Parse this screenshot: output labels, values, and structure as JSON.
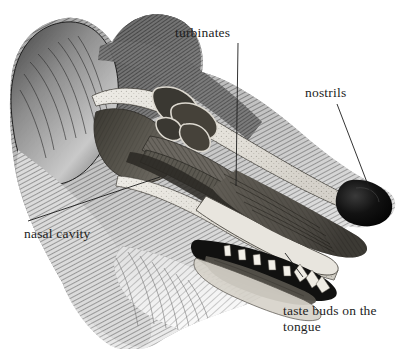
{
  "figure": {
    "background_color": "#ffffff",
    "ink_color": "#1d1d1d",
    "style": "engraving",
    "width": 403,
    "height": 349
  },
  "labels": [
    {
      "id": "turbinates",
      "text": "turbinates",
      "x": 175,
      "y": 25,
      "leader": {
        "x1": 238,
        "y1": 43,
        "x2": 236,
        "y2": 186
      }
    },
    {
      "id": "nostrils",
      "text": "nostrils",
      "x": 305,
      "y": 85,
      "leader": {
        "x1": 337,
        "y1": 104,
        "x2": 373,
        "y2": 198
      }
    },
    {
      "id": "nasal_cavity",
      "text": "nasal cavity",
      "x": 24,
      "y": 226,
      "leader": {
        "x1": 160,
        "y1": 177,
        "x2": 28,
        "y2": 221
      }
    },
    {
      "id": "taste_buds",
      "text": "taste buds on the\ntongue",
      "x": 283,
      "y": 303,
      "leader": {
        "x1": 303,
        "y1": 277,
        "x2": 285,
        "y2": 253
      }
    }
  ],
  "anatomy_parts": [
    {
      "name": "front-ear"
    },
    {
      "name": "back-ear"
    },
    {
      "name": "skull-cranium"
    },
    {
      "name": "nasal-cavity-chamber"
    },
    {
      "name": "turbinate-scrolls"
    },
    {
      "name": "hard-palate"
    },
    {
      "name": "nasal-passage"
    },
    {
      "name": "nose-tip"
    },
    {
      "name": "upper-teeth"
    },
    {
      "name": "lower-teeth"
    },
    {
      "name": "tongue"
    },
    {
      "name": "lower-jaw"
    },
    {
      "name": "cheek-fur"
    },
    {
      "name": "neck-fur"
    }
  ]
}
